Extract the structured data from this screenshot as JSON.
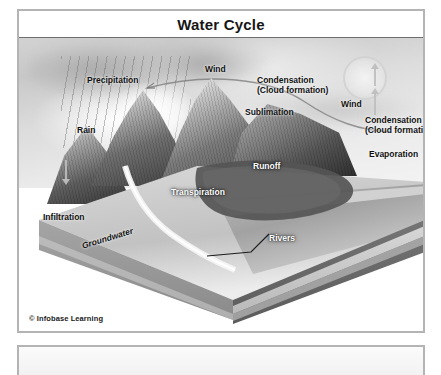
{
  "figure": {
    "title": "Water Cycle",
    "credit": "© Infobase Learning"
  },
  "labels": {
    "precipitation": "Precipitation",
    "wind_left": "Wind",
    "condensation_left": "Condensation\n(Cloud formation)",
    "wind_right": "Wind",
    "condensation_right": "Condensation\n(Cloud formation)",
    "sublimation": "Sublimation",
    "rain": "Rain",
    "runoff": "Runoff",
    "evaporation": "Evaporation",
    "transpiration": "Transpiration",
    "infiltration": "Infiltration",
    "groundwater": "Groundwater",
    "rivers": "Rivers"
  },
  "colors": {
    "frame_border": "#b4b4b4",
    "title_rule": "#6e6e6e",
    "label_dark": "#101010",
    "label_light": "#ffffff",
    "page_background": "#ffffff"
  }
}
